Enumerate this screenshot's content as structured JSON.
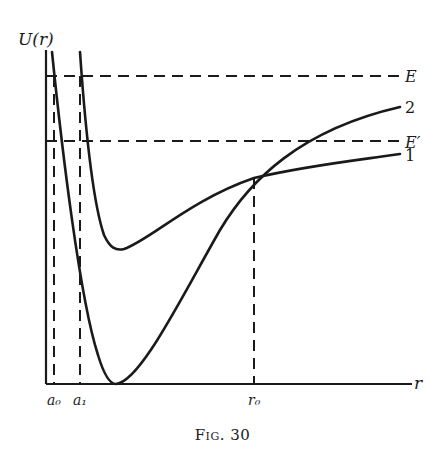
{
  "figure": {
    "caption_word": "Fig.",
    "caption_number": "30",
    "y_axis_label": "U(r)",
    "x_axis_label": "r",
    "energy_levels": [
      {
        "label": "E",
        "y": 76
      },
      {
        "label": "E′",
        "y": 141
      }
    ],
    "x_markers": [
      {
        "label": "a₀",
        "x": 54
      },
      {
        "label": "a₁",
        "x": 80
      },
      {
        "label": "r₀",
        "x": 254
      }
    ],
    "curves": [
      {
        "label": "1",
        "description": "shallow potential well, minimum near r≈118"
      },
      {
        "label": "2",
        "description": "deep potential well, minimum touching r-axis near r≈114"
      }
    ],
    "colors": {
      "ink": "#1a1a1a",
      "background": "#ffffff"
    }
  }
}
